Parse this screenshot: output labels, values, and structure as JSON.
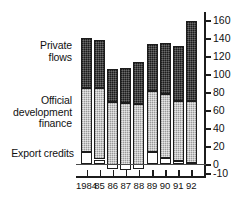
{
  "chart_data": {
    "type": "bar",
    "subtype": "stacked-vertical",
    "title": "",
    "xlabel": "",
    "ylabel": "",
    "categories": [
      "1984",
      "85",
      "86",
      "87",
      "88",
      "89",
      "90",
      "91",
      "92"
    ],
    "series": [
      {
        "name": "Export credits",
        "values": [
          13,
          5,
          -5,
          -7,
          -6,
          13,
          7,
          3,
          1
        ]
      },
      {
        "name": "Official development finance",
        "values": [
          72,
          79,
          74,
          75,
          73,
          68,
          71,
          67,
          69
        ]
      },
      {
        "name": "Private flows",
        "values": [
          55,
          54,
          37,
          39,
          46,
          52,
          57,
          61,
          89
        ]
      }
    ],
    "totals": [
      140,
      138,
      106,
      107,
      113,
      133,
      135,
      131,
      159
    ],
    "segment_tops": {
      "export_credits": [
        13,
        5,
        -5,
        -7,
        -6,
        13,
        7,
        3,
        1
      ],
      "official_development_finance": [
        85,
        84,
        69,
        68,
        67,
        81,
        78,
        70,
        70
      ],
      "private_flows": [
        140,
        138,
        106,
        107,
        113,
        133,
        135,
        131,
        159
      ]
    },
    "ylim": [
      -10,
      160
    ],
    "yticks": [
      -10,
      0,
      20,
      40,
      60,
      80,
      100,
      120,
      140,
      160
    ],
    "ytick_labels": [
      "-10",
      "0",
      "20",
      "40",
      "60",
      "80",
      "100",
      "120",
      "140",
      "160"
    ],
    "yaxis_position": "right",
    "grid": false,
    "legend_position": "left-inline-labels",
    "colors": {
      "private_flows": "#434343",
      "official_development_finance": "#c9c9c9",
      "export_credits": "#ffffff",
      "axis": "#1c1c1c",
      "text": "#111111"
    }
  },
  "labels": {
    "private_flows": "Private\nflows",
    "official_development_finance": "Official\ndevelopment\nfinance",
    "export_credits": "Export credits"
  }
}
